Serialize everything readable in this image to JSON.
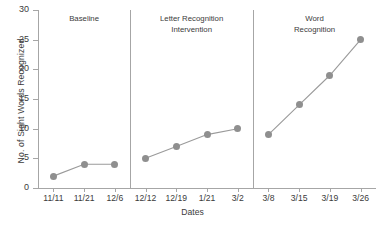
{
  "chart_data": {
    "type": "line",
    "title": "",
    "xlabel": "Dates",
    "ylabel": "No. of Sight Words Recognized",
    "categories": [
      "11/11",
      "11/21",
      "12/6",
      "12/12",
      "12/19",
      "1/21",
      "3/2",
      "3/8",
      "3/15",
      "3/19",
      "3/26"
    ],
    "ylim": [
      0,
      30
    ],
    "yticks": [
      0,
      5,
      10,
      15,
      20,
      25,
      30
    ],
    "grid": false,
    "legend": "none",
    "marker_color": "#8f8f8f",
    "line_color": "#9a9a9a",
    "axis_color": "#a6a6a6",
    "phases": [
      {
        "name": "Baseline",
        "label": "Baseline",
        "points": [
          {
            "x": "11/11",
            "y": 2
          },
          {
            "x": "11/21",
            "y": 4
          },
          {
            "x": "12/6",
            "y": 4
          }
        ]
      },
      {
        "name": "Letter Recognition Intervention",
        "label": "Letter Recognition\nIntervention",
        "points": [
          {
            "x": "12/12",
            "y": 5
          },
          {
            "x": "12/19",
            "y": 7
          },
          {
            "x": "1/21",
            "y": 9
          },
          {
            "x": "3/2",
            "y": 10
          }
        ]
      },
      {
        "name": "Word Recognition",
        "label": "Word\nRecognition",
        "points": [
          {
            "x": "3/8",
            "y": 9
          },
          {
            "x": "3/15",
            "y": 14
          },
          {
            "x": "3/19",
            "y": 19
          },
          {
            "x": "3/26",
            "y": 25
          }
        ]
      }
    ],
    "series": [
      {
        "name": "Sight words recognized",
        "values": [
          2,
          4,
          4,
          5,
          7,
          9,
          10,
          9,
          14,
          19,
          25
        ]
      }
    ]
  }
}
